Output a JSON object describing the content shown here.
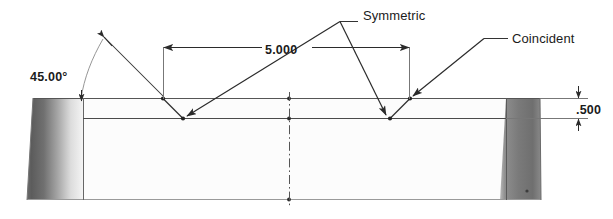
{
  "drawing": {
    "type": "engineering-drawing-side-view",
    "title": "Symmetric notched plate side view",
    "dimensions": [
      {
        "id": "angle",
        "name": "angle-dimension",
        "value": "45.00°",
        "unit": "degrees",
        "number": 45.0
      },
      {
        "id": "length",
        "name": "length-dimension",
        "value": "5.000",
        "unit": "inches",
        "number": 5.0
      },
      {
        "id": "thickness",
        "name": "thickness-dimension",
        "value": ".500",
        "unit": "inches",
        "number": 0.5
      }
    ],
    "annotations": [
      {
        "id": "symmetric",
        "name": "symmetric-relation-label",
        "value": "Symmetric"
      },
      {
        "id": "coincident",
        "name": "coincident-relation-label",
        "value": "Coincident"
      }
    ],
    "colors": {
      "line": "#3a3a3a",
      "outline": "#555555",
      "annotation_text": "#1b1b1b",
      "block_left_dark": "#5e5e5e",
      "block_left_light": "#f2f2f2",
      "block_right_dark": "#6e6e6e",
      "block_right_light": "#9a9a9a",
      "body_fill": "#fcfcfc",
      "centerline": "#555555",
      "background": "#ffffff"
    },
    "geometry": {
      "plate_left_x": 33,
      "plate_right_x": 540,
      "plate_top_y": 98,
      "plate_bottom_y": 200,
      "step_bottom_y": 118,
      "notch_left_top_x": 163,
      "notch_left_bot_x": 183,
      "notch_right_top_x": 410,
      "notch_right_bot_x": 390,
      "centerline_x": 289
    }
  }
}
